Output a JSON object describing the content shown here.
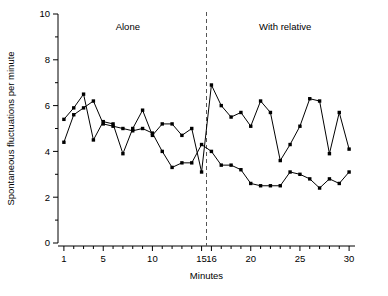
{
  "chart_data": {
    "type": "line",
    "title": "",
    "xlabel": "Minutes",
    "ylabel": "Spontaneous fluctuations per minute",
    "xlim": [
      0.4,
      30.6
    ],
    "ylim": [
      0,
      10
    ],
    "grid": false,
    "legend_position": "none",
    "annotations": [
      {
        "text": "Alone",
        "x": 7.5,
        "y": 9.3
      },
      {
        "text": "With relative",
        "x": 23.5,
        "y": 9.3
      }
    ],
    "divider": {
      "x": 15.5,
      "style": "dashed",
      "color": "#555555"
    },
    "x_ticks_major": [
      1,
      5,
      10,
      15,
      16,
      20,
      25,
      30
    ],
    "x_ticks_minor": [
      2,
      3,
      4,
      6,
      7,
      8,
      9,
      11,
      12,
      13,
      14,
      17,
      18,
      19,
      21,
      22,
      23,
      24,
      26,
      27,
      28,
      29
    ],
    "y_ticks_major": [
      0,
      2,
      4,
      6,
      8,
      10
    ],
    "y_ticks_minor": [
      1,
      3,
      5,
      7,
      9
    ],
    "x": [
      1,
      2,
      3,
      4,
      5,
      6,
      7,
      8,
      9,
      10,
      11,
      12,
      13,
      14,
      15,
      16,
      17,
      18,
      19,
      20,
      21,
      22,
      23,
      24,
      25,
      26,
      27,
      28,
      29,
      30
    ],
    "series": [
      {
        "name": "series-a",
        "marker": "filled-square",
        "values": [
          5.4,
          5.9,
          6.5,
          4.5,
          5.3,
          5.2,
          3.9,
          5.0,
          5.8,
          4.7,
          5.2,
          5.2,
          4.7,
          5.0,
          3.1,
          6.9,
          6.0,
          5.5,
          5.7,
          5.1,
          6.2,
          5.7,
          3.6,
          4.3,
          5.1,
          6.3,
          6.2,
          3.9,
          5.7,
          4.1
        ]
      },
      {
        "name": "series-b",
        "marker": "filled-square",
        "values": [
          4.4,
          5.6,
          5.9,
          6.2,
          5.2,
          5.1,
          5.0,
          4.9,
          5.0,
          4.8,
          4.0,
          3.3,
          3.5,
          3.5,
          4.3,
          4.0,
          3.4,
          3.4,
          3.2,
          2.6,
          2.5,
          2.5,
          2.5,
          3.1,
          3.0,
          2.8,
          2.4,
          2.8,
          2.6,
          3.1
        ]
      }
    ]
  },
  "axis": {
    "x_label": "Minutes",
    "y_label": "Spontaneous fluctuations per minute",
    "x_tick_labels": [
      "1",
      "5",
      "10",
      "15",
      "16",
      "20",
      "25",
      "30"
    ],
    "y_tick_labels": [
      "0",
      "2",
      "4",
      "6",
      "8",
      "10"
    ]
  },
  "labels": {
    "alone": "Alone",
    "with_relative": "With relative"
  }
}
